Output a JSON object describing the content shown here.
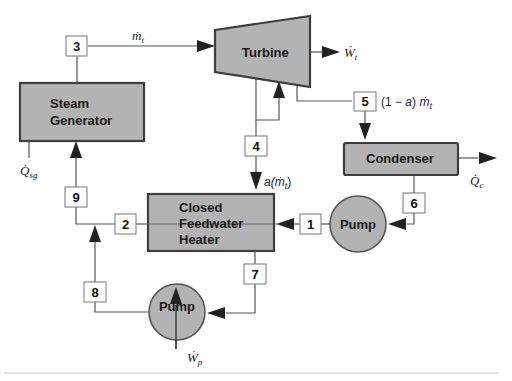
{
  "diagram": {
    "components": {
      "turbine": "Turbine",
      "steam_generator": [
        "Steam",
        "Generator"
      ],
      "condenser": "Condenser",
      "feedwater_heater": [
        "Closed",
        "Feedwater",
        "Heater"
      ],
      "pump_condensate": "Pump",
      "pump_drain": "Pump"
    },
    "states": [
      "1",
      "2",
      "3",
      "4",
      "5",
      "6",
      "7",
      "8",
      "9"
    ],
    "labels": {
      "mass_flow_turbine": "ṁt",
      "turbine_work": "Ẇt",
      "extraction_flow": "a(ṁt)",
      "exhaust_flow": "(1 − a) ṁt",
      "condenser_heat": "Q̇c",
      "sg_heat": "Q̇sg",
      "pump_work": "Ẇp"
    },
    "label_parts": {
      "m_t": {
        "base": "ṁ",
        "sub": "t"
      },
      "W_t": {
        "base": "Ẇ",
        "sub": "t"
      },
      "a_m_t": {
        "pre": "a(",
        "base": "ṁ",
        "sub": "t",
        "post": ")"
      },
      "one_minus_a": {
        "pre": "(1 − ",
        "a": "a",
        "post": ") ",
        "base": "ṁ",
        "sub": "t"
      },
      "Q_c": {
        "base": "Q̇",
        "sub": "c"
      },
      "Q_sg": {
        "base": "Q̇",
        "sub": "sg"
      },
      "W_p": {
        "base": "Ẇ",
        "sub": "p"
      }
    },
    "colors": {
      "component_fill": "#b3b3b3",
      "component_stroke": "#3d3d3d",
      "line": "#555555",
      "arrow": "#222222"
    }
  }
}
